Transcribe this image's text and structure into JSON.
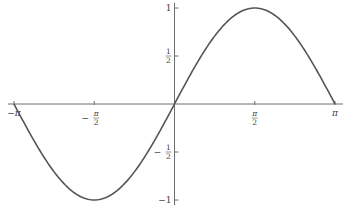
{
  "chart_data": {
    "type": "line",
    "title": "",
    "xlabel": "",
    "ylabel": "",
    "function": "sin(x)",
    "xlim": [
      -3.14159,
      3.14159
    ],
    "ylim": [
      -1,
      1
    ],
    "grid": false,
    "legend": "none",
    "x_ticks": [
      {
        "value": -3.14159,
        "label": "−π",
        "fraction": false,
        "sign": "",
        "num": "",
        "den": ""
      },
      {
        "value": -1.5708,
        "label": "−π/2",
        "fraction": true,
        "sign": "−",
        "num": "π",
        "den": "2"
      },
      {
        "value": 1.5708,
        "label": "π/2",
        "fraction": true,
        "sign": "",
        "num": "π",
        "den": "2"
      },
      {
        "value": 3.14159,
        "label": "π",
        "fraction": false,
        "sign": "",
        "num": "",
        "den": ""
      }
    ],
    "y_ticks": [
      {
        "value": 1,
        "label": "1",
        "fraction": false,
        "sign": "",
        "num": "",
        "den": ""
      },
      {
        "value": 0.5,
        "label": "1/2",
        "fraction": true,
        "sign": "",
        "num": "1",
        "den": "2"
      },
      {
        "value": -0.5,
        "label": "−1/2",
        "fraction": true,
        "sign": "−",
        "num": "1",
        "den": "2"
      },
      {
        "value": -1,
        "label": "−1",
        "fraction": false,
        "sign": "",
        "num": "",
        "den": ""
      }
    ],
    "series": [
      {
        "name": "sin(x)",
        "color": "#555555",
        "x": [
          -3.14159,
          -2.35619,
          -1.5708,
          -0.7854,
          0,
          0.7854,
          1.5708,
          2.35619,
          3.14159
        ],
        "y": [
          0,
          -0.7071,
          -1,
          -0.7071,
          0,
          0.7071,
          1,
          0.7071,
          0
        ]
      }
    ]
  }
}
